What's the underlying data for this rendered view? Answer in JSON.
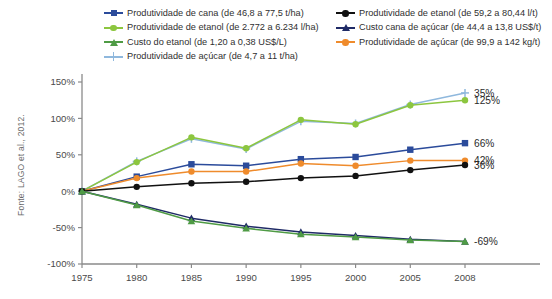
{
  "source": {
    "text": "Fonte: LAGO et al., 2012."
  },
  "legend": {
    "left_column": [
      {
        "label": "Produtividade de cana (de 46,8 a 77,5 t/ha)",
        "color": "#2b4b9b",
        "marker": "square"
      },
      {
        "label": "Produtividade de etanol (de 2.772 a 6.234 l/ha)",
        "color": "#8cc63f",
        "marker": "circle"
      },
      {
        "label": "Custo do etanol (de 1,20 a 0,38 US$/L)",
        "color": "#4f9b45",
        "marker": "triangle"
      },
      {
        "label": "Produtividade de açúcar (de 4,7 a 11 t/ha)",
        "color": "#8fb8dd",
        "marker": "plus"
      }
    ],
    "right_column": [
      {
        "label": "Produtividade de etanol (de 59,2 a 80,44 l/t)",
        "color": "#111111",
        "marker": "circle"
      },
      {
        "label": "Custo cana de açúcar (de 44,4 a 13,8 US$/t)",
        "color": "#1f2a66",
        "marker": "triangle"
      },
      {
        "label": "Produtividade de açúcar (de 99,9 a 142 kg/t)",
        "color": "#ef8b2c",
        "marker": "circle"
      }
    ]
  },
  "chart_data": {
    "type": "line",
    "title": "",
    "xlabel": "",
    "ylabel": "",
    "x": [
      "1975",
      "1980",
      "1985",
      "1990",
      "1995",
      "2000",
      "2005",
      "2008"
    ],
    "ylim": [
      -100,
      150
    ],
    "yticks": [
      150,
      100,
      50,
      0,
      -50,
      -100
    ],
    "ytick_labels": [
      "150%",
      "100%",
      "50%",
      "0%",
      "-50%",
      "-100%"
    ],
    "grid": false,
    "legend_position": "top",
    "series": [
      {
        "name": "Produtividade de açúcar (de 4,7 a 11 t/ha)",
        "color": "#8fb8dd",
        "marker": "plus",
        "values": [
          0,
          41,
          72,
          58,
          96,
          93,
          119,
          135
        ],
        "end_label": "35%"
      },
      {
        "name": "Produtividade de etanol (de 2.772 a 6.234 l/ha)",
        "color": "#8cc63f",
        "marker": "circle",
        "values": [
          0,
          40,
          74,
          59,
          98,
          92,
          118,
          125
        ],
        "end_label": "125%"
      },
      {
        "name": "Produtividade de cana (de 46,8 a 77,5 t/ha)",
        "color": "#2b4b9b",
        "marker": "square",
        "values": [
          0,
          20,
          37,
          35,
          44,
          47,
          57,
          66
        ],
        "end_label": "66%"
      },
      {
        "name": "Produtividade de açúcar (de 99,9 a 142 kg/t)",
        "color": "#ef8b2c",
        "marker": "circle",
        "values": [
          0,
          18,
          27,
          27,
          38,
          35,
          42,
          42
        ],
        "end_label": "42%"
      },
      {
        "name": "Produtividade de etanol (de 59,2 a 80,44 l/t)",
        "color": "#111111",
        "marker": "circle",
        "values": [
          0,
          6,
          11,
          13,
          18,
          21,
          29,
          36
        ],
        "end_label": "36%"
      },
      {
        "name": "Custo cana de açúcar (de 44,4 a 13,8 US$/t)",
        "color": "#1f2a66",
        "marker": "triangle",
        "values": [
          0,
          -18,
          -37,
          -48,
          -56,
          -61,
          -66,
          -69
        ],
        "end_label": ""
      },
      {
        "name": "Custo do etanol (de 1,20 a 0,38 US$/L)",
        "color": "#4f9b45",
        "marker": "triangle",
        "values": [
          0,
          -19,
          -41,
          -51,
          -59,
          -63,
          -67,
          -69
        ],
        "end_label": "-69%"
      }
    ],
    "end_labels": [
      {
        "text": "35%",
        "value": 135,
        "color": "#2b2b2b"
      },
      {
        "text": "125%",
        "value": 125,
        "color": "#2b2b2b"
      },
      {
        "text": "66%",
        "value": 66,
        "color": "#2b2b2b"
      },
      {
        "text": "42%",
        "value": 42,
        "color": "#2b2b2b"
      },
      {
        "text": "36%",
        "value": 36,
        "color": "#2b2b2b"
      },
      {
        "text": "-69%",
        "value": -69,
        "color": "#2b2b2b"
      }
    ]
  }
}
